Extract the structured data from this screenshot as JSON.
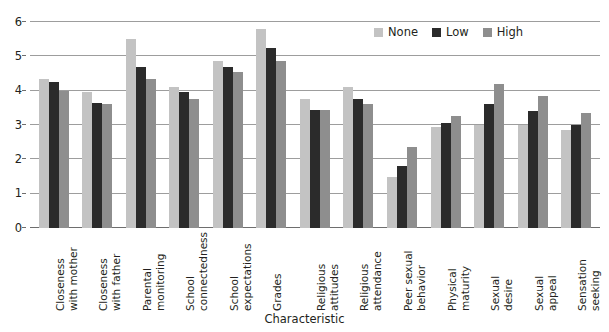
{
  "chart_data": {
    "type": "bar",
    "title": "",
    "xlabel": "Characteristic",
    "ylabel": "",
    "ylim": [
      0,
      6
    ],
    "yticks": [
      0,
      1,
      2,
      3,
      4,
      5,
      6
    ],
    "grid": true,
    "legend_position": "top-right",
    "categories": [
      "Closeness with mother",
      "Closeness with father",
      "Parental monitoring",
      "School connectedness",
      "School expectations",
      "Grades",
      "Religious attitudes",
      "Religious attendance",
      "Peer sexual behavior",
      "Physical maturity",
      "Sexual desire",
      "Sexual appeal",
      "Sensation seeking"
    ],
    "category_lines": [
      [
        "Closeness",
        "with mother"
      ],
      [
        "Closeness",
        "with father"
      ],
      [
        "Parental",
        "monitoring"
      ],
      [
        "School",
        "connectedness"
      ],
      [
        "School",
        "expectations"
      ],
      [
        "Grades",
        ""
      ],
      [
        "Religious",
        "attitudes"
      ],
      [
        "Religious",
        "attendance"
      ],
      [
        "Peer sexual",
        "behavior"
      ],
      [
        "Physical",
        "maturity"
      ],
      [
        "Sexual",
        "desire"
      ],
      [
        "Sexual",
        "appeal"
      ],
      [
        "Sensation",
        "seeking"
      ]
    ],
    "series": [
      {
        "name": "None",
        "color": "#c3c3c3",
        "values": [
          4.35,
          3.95,
          5.5,
          4.1,
          4.85,
          5.8,
          3.75,
          4.1,
          1.5,
          2.95,
          3.0,
          3.0,
          2.85
        ]
      },
      {
        "name": "Low",
        "color": "#2b2b2b",
        "values": [
          4.25,
          3.65,
          4.7,
          3.95,
          4.7,
          5.25,
          3.45,
          3.75,
          1.8,
          3.05,
          3.6,
          3.4,
          3.0
        ]
      },
      {
        "name": "High",
        "color": "#8e8e8e",
        "values": [
          4.0,
          3.6,
          4.35,
          3.75,
          4.55,
          4.85,
          3.45,
          3.6,
          2.35,
          3.25,
          4.2,
          3.85,
          3.35
        ]
      }
    ]
  },
  "legend": {
    "items": [
      {
        "label": "None",
        "key": "none"
      },
      {
        "label": "Low",
        "key": "low"
      },
      {
        "label": "High",
        "key": "high"
      }
    ]
  }
}
